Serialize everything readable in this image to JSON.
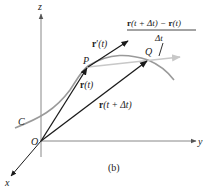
{
  "figure": {
    "panel_label": "(b)",
    "axes": {
      "x": "x",
      "y": "y",
      "z": "z",
      "origin": "O"
    },
    "curve_label": "C",
    "points": {
      "P": "P",
      "Q": "Q"
    },
    "vectors": {
      "r_t": {
        "bold": "r",
        "arg": "(t)"
      },
      "r_t_dt": {
        "bold": "r",
        "arg": "(t + Δt)"
      },
      "r_prime": {
        "bold": "r",
        "prime": "′",
        "arg": "(t)"
      },
      "difference_quotient": {
        "numerator_part1_bold": "r",
        "numerator_part1_arg": "(t + Δt) − ",
        "numerator_part2_bold": "r",
        "numerator_part2_arg": "(t)",
        "denominator": "Δt"
      }
    },
    "colors": {
      "ink": "#1a1a1a",
      "axis": "#888888",
      "curve": "#9a9a9a",
      "secant": "#c8c8c8"
    }
  }
}
